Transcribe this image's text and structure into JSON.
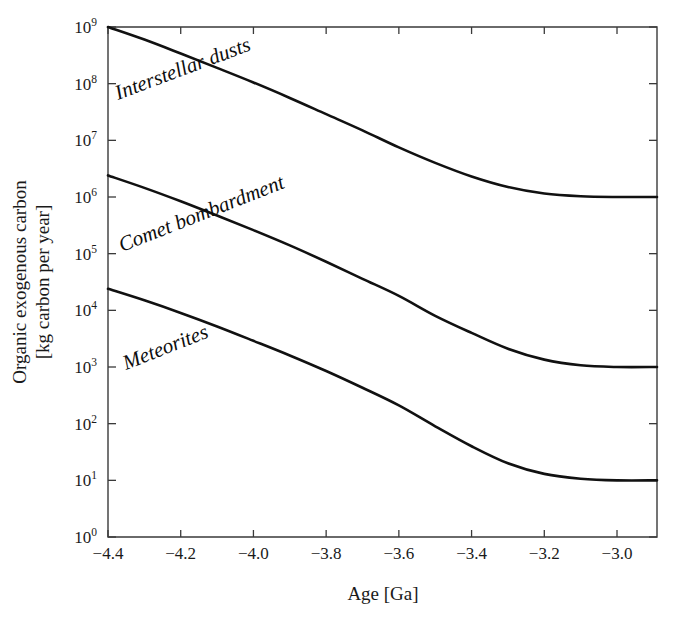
{
  "chart_data": {
    "type": "line",
    "title": "",
    "xlabel": "Age [Ga]",
    "ylabel_line1": "Organic exogenous carbon",
    "ylabel_line2": "[kg carbon per year]",
    "yscale": "log",
    "xlim": [
      -4.4,
      -2.89
    ],
    "ylim": [
      1,
      1000000000
    ],
    "grid": false,
    "legend_position": "inline-curve-labels",
    "xticks": [
      -4.4,
      -4.2,
      -4.0,
      -3.8,
      -3.6,
      -3.4,
      -3.2,
      -3.0
    ],
    "xtick_labels": [
      "−4.4",
      "−4.2",
      "−4.0",
      "−3.8",
      "−3.6",
      "−3.4",
      "−3.2",
      "−3.0"
    ],
    "yticks": [
      1,
      10,
      100,
      1000,
      10000,
      100000,
      1000000,
      10000000,
      100000000,
      1000000000
    ],
    "ytick_labels": [
      {
        "base": "10",
        "exp": "0"
      },
      {
        "base": "10",
        "exp": "1"
      },
      {
        "base": "10",
        "exp": "2"
      },
      {
        "base": "10",
        "exp": "3"
      },
      {
        "base": "10",
        "exp": "4"
      },
      {
        "base": "10",
        "exp": "5"
      },
      {
        "base": "10",
        "exp": "6"
      },
      {
        "base": "10",
        "exp": "7"
      },
      {
        "base": "10",
        "exp": "8"
      },
      {
        "base": "10",
        "exp": "9"
      }
    ],
    "series": [
      {
        "name": "Interstellar dusts",
        "label": "Interstellar dusts",
        "color": "#111111",
        "x": [
          -4.4,
          -4.3,
          -4.2,
          -4.1,
          -4.0,
          -3.9,
          -3.8,
          -3.7,
          -3.6,
          -3.5,
          -3.4,
          -3.3,
          -3.2,
          -3.1,
          -3.0,
          -2.89
        ],
        "y": [
          1000000000.0,
          600000000.0,
          340000000.0,
          190000000.0,
          105000000.0,
          56000000.0,
          29000000.0,
          15000000.0,
          7500000.0,
          4000000.0,
          2300000.0,
          1500000.0,
          1150000.0,
          1030000.0,
          1000000.0,
          1000000.0
        ]
      },
      {
        "name": "Comet bombardment",
        "label": "Comet bombardment",
        "color": "#111111",
        "x": [
          -4.4,
          -4.3,
          -4.2,
          -4.1,
          -4.0,
          -3.9,
          -3.8,
          -3.7,
          -3.6,
          -3.5,
          -3.4,
          -3.3,
          -3.2,
          -3.1,
          -3.0,
          -2.89
        ],
        "y": [
          2400000.0,
          1450000.0,
          840000.0,
          470000.0,
          260000.0,
          140000.0,
          72000.0,
          36000.0,
          18000.0,
          8000.0,
          4000.0,
          2100.0,
          1350.0,
          1070.0,
          1000.0,
          1000.0
        ]
      },
      {
        "name": "Meteorites",
        "label": "Meteorites",
        "color": "#111111",
        "x": [
          -4.4,
          -4.3,
          -4.2,
          -4.1,
          -4.0,
          -3.9,
          -3.8,
          -3.7,
          -3.6,
          -3.5,
          -3.4,
          -3.3,
          -3.2,
          -3.1,
          -3.0,
          -2.89
        ],
        "y": [
          24000.0,
          15000.0,
          9000.0,
          5200.0,
          2900.0,
          1600.0,
          850.0,
          430.0,
          210.0,
          90.0,
          40.0,
          20.0,
          13.0,
          10.7,
          10.0,
          10.0
        ]
      }
    ],
    "annotations": [
      {
        "text": "Interstellar dusts",
        "x": 118,
        "y": 100,
        "rotation": -20.5
      },
      {
        "text": "Comet bombardment",
        "x": 122,
        "y": 252,
        "rotation": -21.5
      },
      {
        "text": "Meteorites",
        "x": 126,
        "y": 370,
        "rotation": -21.5
      }
    ]
  },
  "plot": {
    "left": 108,
    "right": 657,
    "top": 27,
    "bottom": 537
  }
}
